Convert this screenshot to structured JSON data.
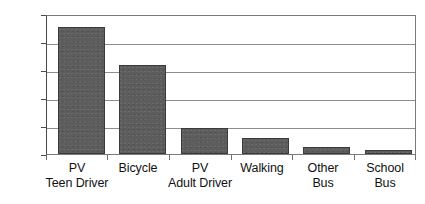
{
  "chart_data": {
    "type": "bar",
    "title": "",
    "subtitle": "",
    "xlabel": "",
    "ylabel": "",
    "ylim": [
      0,
      2500
    ],
    "yticks": [
      0,
      500,
      1000,
      1500,
      2000,
      2500
    ],
    "ytick_labels": [
      "0",
      "500",
      "1000",
      "1500",
      "2000",
      "2500"
    ],
    "grid": "horizontal",
    "legend": "none",
    "bar_color": "#5d5d5d",
    "bar_edge_color": "#3b3b3b",
    "categories": [
      "PV Teen Driver",
      "Bicycle",
      "PV Adult Driver",
      "Walking",
      "Other Bus",
      "School Bus"
    ],
    "category_lines": [
      [
        "PV",
        "Teen Driver"
      ],
      [
        "Bicycle",
        ""
      ],
      [
        "PV",
        "Adult Driver"
      ],
      [
        "Walking",
        ""
      ],
      [
        "Other",
        "Bus"
      ],
      [
        "School",
        "Bus"
      ]
    ],
    "values": [
      2300,
      1610,
      470,
      290,
      120,
      70
    ]
  }
}
